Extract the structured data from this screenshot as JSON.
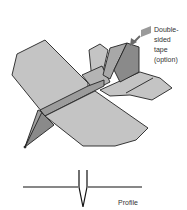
{
  "diagram": {
    "labels": {
      "tape_line1": "Double-",
      "tape_line2": "sided",
      "tape_line3": "tape",
      "tape_line4": "(option)",
      "profile": "Profile"
    },
    "colors": {
      "panel_light": "#c4c4c4",
      "panel_mid": "#a8a8a8",
      "panel_dark": "#8a8a8a",
      "tape": "#9a9a9a",
      "outline": "#222222",
      "background": "#ffffff"
    }
  }
}
